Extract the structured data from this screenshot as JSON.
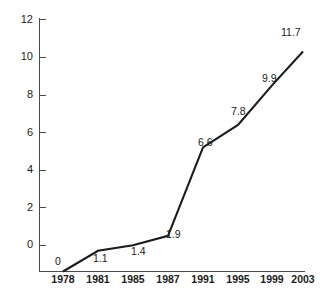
{
  "chart_data": {
    "type": "line",
    "title": "",
    "subtitle": "",
    "xlabel": "",
    "ylabel": "",
    "x": [
      "1978",
      "1981",
      "1985",
      "1987",
      "1991",
      "1995",
      "1999",
      "2003"
    ],
    "categories": [
      "1978",
      "1981",
      "1985",
      "1987",
      "1991",
      "1995",
      "1999",
      "2003"
    ],
    "values": [
      0,
      1.1,
      1.4,
      1.9,
      6.6,
      7.8,
      9.9,
      11.7
    ],
    "point_labels": [
      "0",
      "1.1",
      "1.4",
      "1.9",
      "6.6",
      "7.8",
      "9.9",
      "11.7"
    ],
    "series": [
      {
        "name": "",
        "values": [
          0,
          1.1,
          1.4,
          1.9,
          6.6,
          7.8,
          9.9,
          11.7
        ]
      }
    ],
    "ylim": [
      0,
      12
    ],
    "y_ticks": [
      0,
      2,
      4,
      6,
      8,
      10,
      12
    ],
    "y_tick_labels": [
      "0",
      "2",
      "4",
      "6",
      "8",
      "10",
      "12"
    ],
    "x_tick_labels": [
      "1978",
      "1981",
      "1985",
      "1987",
      "1991",
      "1995",
      "1999",
      "2003"
    ],
    "grid": false,
    "legend": false,
    "legend_position": "none",
    "markers": false,
    "annotations": [
      {
        "label": "0",
        "x": "1978",
        "y": 0
      },
      {
        "label": "1.1",
        "x": "1981",
        "y": 1.1
      },
      {
        "label": "1.4",
        "x": "1985",
        "y": 1.4
      },
      {
        "label": "1.9",
        "x": "1987",
        "y": 1.9
      },
      {
        "label": "6.6",
        "x": "1991",
        "y": 6.6
      },
      {
        "label": "7.8",
        "x": "1995",
        "y": 7.8
      },
      {
        "label": "9.9",
        "x": "1999",
        "y": 9.9
      },
      {
        "label": "11.7",
        "x": "2003",
        "y": 11.7
      }
    ],
    "colors": {
      "line": "#1b1b1b",
      "axis": "#4a4a4a",
      "text": "#1b1b1b",
      "background": "#ffffff"
    }
  },
  "axes": {
    "y_tick_0": "0",
    "y_tick_2": "2",
    "y_tick_4": "4",
    "y_tick_6": "6",
    "y_tick_8": "8",
    "y_tick_10": "10",
    "y_tick_12": "12",
    "x_tick_0": "1978",
    "x_tick_1": "1981",
    "x_tick_2": "1985",
    "x_tick_3": "1987",
    "x_tick_4": "1991",
    "x_tick_5": "1995",
    "x_tick_6": "1999",
    "x_tick_7": "2003"
  },
  "labels": {
    "p0": "0",
    "p1": "1.1",
    "p2": "1.4",
    "p3": "1.9",
    "p4": "6.6",
    "p5": "7.8",
    "p6": "9.9",
    "p7": "11.7"
  }
}
